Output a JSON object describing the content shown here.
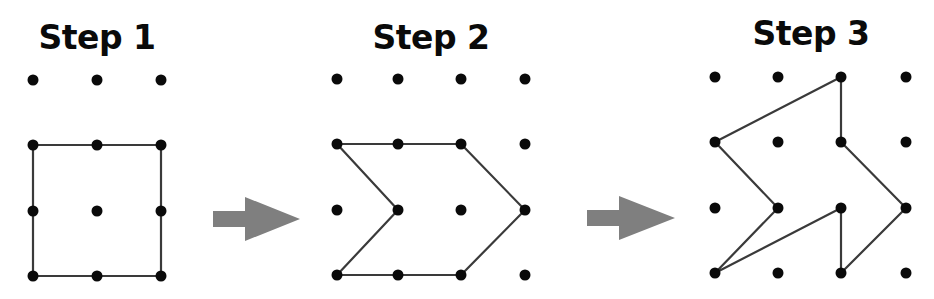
{
  "colors": {
    "dot": "#0a0a0a",
    "line": "#3a3a3a",
    "arrow": "#7f7f7f",
    "background": "#ffffff"
  },
  "steps": [
    {
      "title": "Step 1",
      "title_center_x": 97,
      "grid_x": [
        33,
        97,
        161
      ],
      "grid_y": [
        80,
        145,
        211,
        276
      ],
      "dots": [
        [
          0,
          0
        ],
        [
          1,
          0
        ],
        [
          2,
          0
        ],
        [
          0,
          1
        ],
        [
          1,
          1
        ],
        [
          2,
          1
        ],
        [
          0,
          2
        ],
        [
          1,
          2
        ],
        [
          2,
          2
        ],
        [
          0,
          3
        ],
        [
          1,
          3
        ],
        [
          2,
          3
        ]
      ],
      "polygon": [
        [
          0,
          1
        ],
        [
          1,
          1
        ],
        [
          2,
          1
        ],
        [
          2,
          2
        ],
        [
          2,
          3
        ],
        [
          1,
          3
        ],
        [
          0,
          3
        ],
        [
          0,
          2
        ]
      ]
    },
    {
      "title": "Step 2",
      "title_center_x": 431,
      "grid_x": [
        337,
        398,
        461,
        525
      ],
      "grid_y": [
        79,
        144,
        210,
        275
      ],
      "dots": [
        [
          0,
          0
        ],
        [
          1,
          0
        ],
        [
          2,
          0
        ],
        [
          3,
          0
        ],
        [
          0,
          1
        ],
        [
          1,
          1
        ],
        [
          2,
          1
        ],
        [
          3,
          1
        ],
        [
          0,
          2
        ],
        [
          1,
          2
        ],
        [
          2,
          2
        ],
        [
          3,
          2
        ],
        [
          0,
          3
        ],
        [
          1,
          3
        ],
        [
          2,
          3
        ],
        [
          3,
          3
        ]
      ],
      "polygon": [
        [
          0,
          1
        ],
        [
          1,
          1
        ],
        [
          2,
          1
        ],
        [
          3,
          2
        ],
        [
          2,
          3
        ],
        [
          1,
          3
        ],
        [
          0,
          3
        ],
        [
          1,
          2
        ]
      ]
    },
    {
      "title": "Step 3",
      "title_center_x": 811,
      "grid_x": [
        715,
        778,
        841,
        906
      ],
      "grid_y": [
        77,
        142,
        208,
        273
      ],
      "dots": [
        [
          0,
          0
        ],
        [
          1,
          0
        ],
        [
          2,
          0
        ],
        [
          3,
          0
        ],
        [
          0,
          1
        ],
        [
          1,
          1
        ],
        [
          2,
          1
        ],
        [
          3,
          1
        ],
        [
          0,
          2
        ],
        [
          1,
          2
        ],
        [
          2,
          2
        ],
        [
          3,
          2
        ],
        [
          0,
          3
        ],
        [
          1,
          3
        ],
        [
          2,
          3
        ],
        [
          3,
          3
        ]
      ],
      "polygon": [
        [
          2,
          0
        ],
        [
          2,
          1
        ],
        [
          3,
          2
        ],
        [
          2,
          3
        ],
        [
          2,
          2
        ],
        [
          0,
          3
        ],
        [
          1,
          2
        ],
        [
          0,
          1
        ]
      ]
    }
  ],
  "arrows": [
    {
      "label": "arrow-1-to-2",
      "x_start": 213,
      "x_head": 245,
      "x_tip": 300,
      "y_center": 219,
      "shaft_half": 8,
      "head_half": 22
    },
    {
      "label": "arrow-2-to-3",
      "x_start": 587,
      "x_head": 619,
      "x_tip": 675,
      "y_center": 218,
      "shaft_half": 8,
      "head_half": 22
    }
  ]
}
